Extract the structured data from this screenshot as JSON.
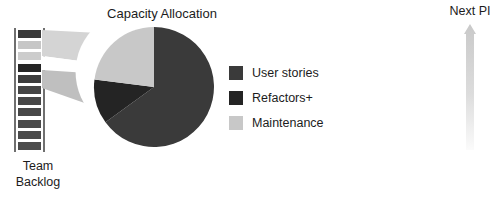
{
  "diagram": {
    "backlog": {
      "caption_line1": "Team",
      "caption_line2": "Backlog",
      "items": [
        {
          "name": "backlog-item-1",
          "color": "#3a3a3a"
        },
        {
          "name": "backlog-item-2",
          "color": "#c6c6c6"
        },
        {
          "name": "backlog-item-3",
          "color": "#cccccc"
        },
        {
          "name": "backlog-item-4",
          "color": "#252525"
        },
        {
          "name": "backlog-item-5",
          "color": "#3c3c3c"
        },
        {
          "name": "backlog-item-6",
          "color": "#454545"
        },
        {
          "name": "backlog-item-7",
          "color": "#474747"
        },
        {
          "name": "backlog-item-8",
          "color": "#484848"
        },
        {
          "name": "backlog-item-9",
          "color": "#4a4a4a"
        },
        {
          "name": "backlog-item-10",
          "color": "#4a4a4a"
        },
        {
          "name": "backlog-item-11",
          "color": "#4c4c4c"
        }
      ],
      "rail_color": "#6f6f6f"
    },
    "funnel": {
      "fill_top": "#d2d2d2",
      "fill_bottom": "#b9b9b9",
      "gap_color": "#ffffff"
    },
    "next_pi": {
      "label": "Next PI",
      "arrow_color_top": "#c9c9c9",
      "arrow_color_bottom": "#f4f4f4"
    }
  },
  "chart_data": {
    "type": "pie",
    "title": "Capacity Allocation",
    "categories": [
      "User stories",
      "Refactors+",
      "Maintenance"
    ],
    "values": [
      65,
      12,
      23
    ],
    "colors": [
      "#3a3a3a",
      "#242424",
      "#c8c8c8"
    ],
    "start_angle": 0,
    "direction": "clockwise",
    "legend_position": "right",
    "grid": false,
    "xlabel": "",
    "ylabel": ""
  }
}
